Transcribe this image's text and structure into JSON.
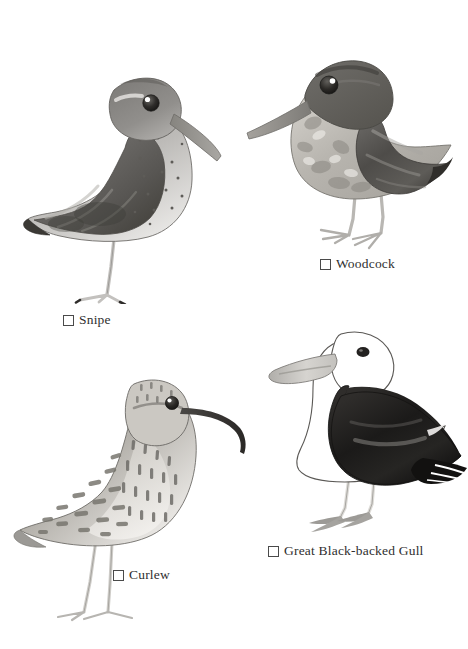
{
  "page": {
    "background_color": "#ffffff",
    "kind": "bird-identification-checklist",
    "width": 468,
    "height": 649
  },
  "palette": {
    "ink": "#2f2f2f",
    "outline": "#5a5a5a",
    "dark_plumage": "#4a4a4a",
    "mid_plumage": "#8c8c8c",
    "light_plumage": "#c9c9c9",
    "pale_plumage": "#e6e4e1",
    "very_dark": "#1c1c1c",
    "bill_gray": "#9a9a9a",
    "leg_gray": "#b7b5b2",
    "eye_dark": "#2a2a2a",
    "eye_highlight": "#ffffff"
  },
  "entries": [
    {
      "id": "snipe",
      "label": "Snipe",
      "checked": false,
      "facing": "right",
      "bill": "long-straight",
      "plumage": "dark-wing-speckled-breast"
    },
    {
      "id": "woodcock",
      "label": "Woodcock",
      "checked": false,
      "facing": "left",
      "bill": "long-straight",
      "plumage": "mottled-dark-wing"
    },
    {
      "id": "curlew",
      "label": "Curlew",
      "checked": false,
      "facing": "right",
      "bill": "long-downcurved",
      "plumage": "streaked-spotted"
    },
    {
      "id": "gull",
      "label": "Great Black-backed Gull",
      "checked": false,
      "facing": "left",
      "bill": "heavy-pale",
      "plumage": "white-body-black-back"
    }
  ]
}
